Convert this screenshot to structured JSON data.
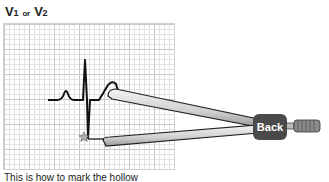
{
  "lead": {
    "main1": "V",
    "sub1": "1",
    "conj": "or",
    "main2": "V",
    "sub2": "2"
  },
  "caption": "This is how to mark the hollow",
  "back_button": {
    "label": "Back"
  },
  "colors": {
    "trace": "#111111",
    "caliper_body": "#d8d8d8",
    "caliper_dark": "#4a4a4a",
    "grid_major": "#c8c8c8",
    "grid_minor": "#e2e2e2"
  }
}
